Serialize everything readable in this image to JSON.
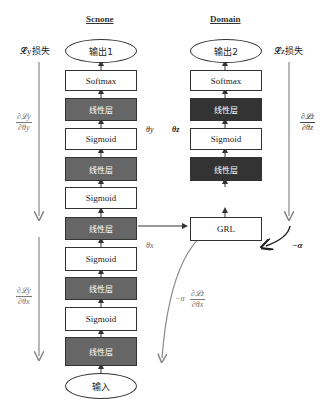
{
  "columns": {
    "source": {
      "title": "Scnone",
      "output": "输出1",
      "input": "输入",
      "layers": [
        "Softmax",
        "线性层",
        "Sigmoid",
        "线性层",
        "Sigmoid",
        "线性层",
        "Sigmoid",
        "线性层",
        "Sigmoid",
        "线性层"
      ],
      "param_y": "θy",
      "param_x": "θx"
    },
    "domain": {
      "title": "Domain",
      "output": "输出2",
      "layers": [
        "Softmax",
        "线性层",
        "Sigmoid",
        "线性层",
        "GRL"
      ],
      "param_z": "θz"
    }
  },
  "losses": {
    "left": "𝓛y损失",
    "right": "𝓛z损失"
  },
  "gradients": {
    "dLy_dthy": {
      "num": "∂𝓛y",
      "den": "∂θy"
    },
    "dLy_dthx": {
      "num": "∂𝓛y",
      "den": "∂θx"
    },
    "dLz_dthz": {
      "num": "∂𝓛z",
      "den": "∂θz"
    },
    "neg_alpha_dLz_dthx": {
      "prefix": "−α",
      "num": "∂𝓛z",
      "den": "∂θx"
    },
    "neg_alpha": "−α"
  },
  "colors": {
    "linear_left": "#666666",
    "linear_right": "#333333",
    "arrow_grey": "#888888",
    "stroke": "#333333"
  }
}
